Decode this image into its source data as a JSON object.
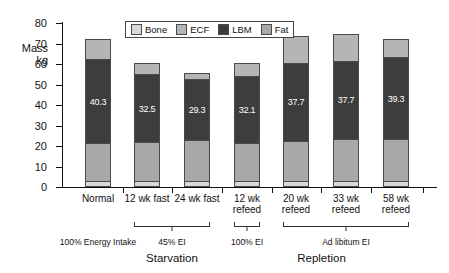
{
  "chart_data": {
    "type": "bar",
    "subtype": "stacked-bar",
    "title": "",
    "xlabel": "",
    "ylabel": "Mass\nkg",
    "ylim": [
      0,
      80
    ],
    "yticks": [
      0,
      10,
      20,
      30,
      40,
      50,
      60,
      70,
      80
    ],
    "grid": false,
    "legend_position": "top-center-inside",
    "stack_order_bottom_to_top": [
      "Bone",
      "Fat",
      "LBM",
      "ECF"
    ],
    "categories": [
      "Normal",
      "12 wk fast",
      "24 wk fast",
      "12 wk\nrefeed",
      "20 wk\nrefeed",
      "33 wk\nrefeed",
      "58 wk\nrefeed"
    ],
    "series": [
      {
        "name": "Bone",
        "color": "#d9d9d9",
        "values": [
          2.0,
          2.0,
          2.0,
          2.0,
          2.0,
          2.0,
          2.0
        ]
      },
      {
        "name": "Fat",
        "color": "#a8a8a8",
        "values": [
          18.0,
          18.5,
          19.5,
          18.0,
          19.0,
          20.0,
          20.0
        ]
      },
      {
        "name": "LBM",
        "color": "#3d3d3d",
        "values": [
          40.3,
          32.5,
          29.3,
          32.1,
          37.7,
          37.7,
          39.3
        ]
      },
      {
        "name": "ECF",
        "color": "#b5b5b5",
        "values": [
          9.7,
          5.0,
          2.2,
          5.9,
          12.3,
          12.3,
          8.7
        ]
      }
    ],
    "totals": [
      70.0,
      58.0,
      53.0,
      58.0,
      71.0,
      72.0,
      70.0
    ],
    "data_labels": {
      "series": "LBM",
      "values": [
        "40.3",
        "32.5",
        "29.3",
        "32.1",
        "37.7",
        "37.7",
        "39.3"
      ]
    },
    "annotations": [
      {
        "text": "100% Energy Intake",
        "covers": [
          "Normal"
        ]
      },
      {
        "text": "45% EI",
        "covers": [
          "12 wk fast",
          "24 wk fast"
        ]
      },
      {
        "text": "100% EI",
        "covers": [
          "12 wk refeed"
        ]
      },
      {
        "text": "Ad libitum EI",
        "covers": [
          "20 wk refeed",
          "33 wk refeed",
          "58 wk refeed"
        ]
      }
    ],
    "phase_labels": [
      {
        "text": "Starvation",
        "covers": [
          "12 wk fast",
          "24 wk fast"
        ]
      },
      {
        "text": "Repletion",
        "covers": [
          "12 wk refeed",
          "20 wk refeed",
          "33 wk refeed",
          "58 wk refeed"
        ]
      }
    ]
  },
  "legend": {
    "items": [
      {
        "label": "Bone"
      },
      {
        "label": "ECF"
      },
      {
        "label": "LBM"
      },
      {
        "label": "Fat"
      }
    ]
  },
  "legend_swatch_colors": [
    "#d9d9d9",
    "#b5b5b5",
    "#3d3d3d",
    "#a8a8a8"
  ],
  "axis": {
    "y_label": "Mass\nkg",
    "ticks": [
      "80",
      "70",
      "60",
      "50",
      "40",
      "30",
      "20",
      "10",
      "0"
    ]
  },
  "annotation_row": {
    "normal": "100% Energy Intake",
    "starvation_ei": "45% EI",
    "refeed_ei": "100% EI",
    "adlib_ei": "Ad libitum EI"
  },
  "phase_row": {
    "starvation": "Starvation",
    "repletion": "Repletion"
  }
}
